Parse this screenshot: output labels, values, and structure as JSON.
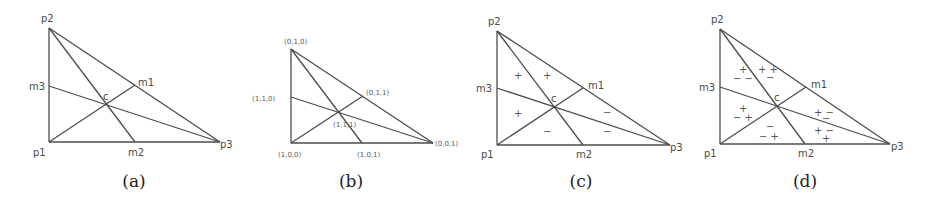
{
  "figure": {
    "panels": [
      {
        "caption": "(a)",
        "labels": {
          "p1": "p1",
          "p2": "p2",
          "p3": "p3",
          "m1": "m1",
          "m2": "m2",
          "m3": "m3",
          "c": "c"
        }
      },
      {
        "caption": "(b)",
        "labels": {
          "p1": "(1,0,0)",
          "p2": "(0,1,0)",
          "p3": "(0,0,1)",
          "m1": "(0,1,1)",
          "m2": "(1,0,1)",
          "m3": "(1,1,0)",
          "c": "(1,1,1)"
        }
      },
      {
        "caption": "(c)",
        "labels": {
          "p1": "p1",
          "p2": "p2",
          "p3": "p3",
          "m1": "m1",
          "m2": "m2",
          "m3": "m3",
          "c": "c"
        },
        "signs": {
          "p2_m3": "+",
          "p2_m1": "+",
          "p1_m3": "+",
          "p1_m2": "−",
          "p3_m2": "−",
          "p3_m1": "−"
        }
      },
      {
        "caption": "(d)",
        "labels": {
          "p1": "p1",
          "p2": "p2",
          "p3": "p3",
          "m1": "m1",
          "m2": "m2",
          "m3": "m3",
          "c": "c"
        },
        "signs": {
          "p2_m3_top": "+",
          "p2_m3_bottom": "− −",
          "p2_m1_top": "+ +",
          "p2_m1_bottom": "−",
          "p1_m3_top": "+",
          "p1_m3_bottom": "− +",
          "p1_m2_top": "−",
          "p1_m2_bottom": "− +",
          "p3_m1_top": "+ −",
          "p3_m1_bottom": "−",
          "p3_m2_top": "+ −",
          "p3_m2_bottom": "+"
        }
      }
    ]
  }
}
